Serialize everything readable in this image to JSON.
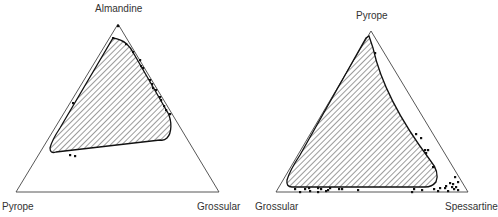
{
  "diagrams": [
    {
      "id": "left",
      "type": "ternary",
      "labels": {
        "top": "Almandine",
        "left": "Pyrope",
        "right": "Grossular"
      },
      "triangle": [
        [
          118,
          24
        ],
        [
          16,
          192
        ],
        [
          219,
          192
        ]
      ],
      "region": "M113,38 C125,40 130,46 134,54 L168,113 C172,121 172,133 167,138 Q164,141 160,140 L56,152 Q50,154 50,148 Q52,140 60,128 Z",
      "points": [
        [
          118,
          26
        ],
        [
          113,
          38
        ],
        [
          126,
          44
        ],
        [
          133,
          52
        ],
        [
          140,
          60
        ],
        [
          141,
          66
        ],
        [
          143,
          68
        ],
        [
          150,
          80
        ],
        [
          152,
          84
        ],
        [
          153,
          88
        ],
        [
          156,
          90
        ],
        [
          160,
          97
        ],
        [
          161,
          100
        ],
        [
          164,
          106
        ],
        [
          166,
          110
        ],
        [
          170,
          114
        ],
        [
          73,
          103
        ],
        [
          70,
          155
        ],
        [
          75,
          156
        ]
      ]
    },
    {
      "id": "right",
      "type": "ternary",
      "labels": {
        "top": "Pyrope",
        "left": "Grossular",
        "right": "Spessartine"
      },
      "triangle": [
        [
          371,
          31
        ],
        [
          276,
          192
        ],
        [
          468,
          192
        ]
      ],
      "region": "M369,36 L373,48 C380,80 400,120 430,160 Q440,172 436,182 Q432,187 425,187 L292,187 Q286,187 287,180 Q290,170 300,155 L366,38 Z",
      "points": [
        [
          375,
          53
        ],
        [
          416,
          134
        ],
        [
          421,
          138
        ],
        [
          425,
          150
        ],
        [
          428,
          150
        ],
        [
          426,
          153
        ],
        [
          433,
          167
        ],
        [
          455,
          177
        ],
        [
          458,
          182
        ],
        [
          450,
          183
        ],
        [
          453,
          184
        ],
        [
          452,
          187
        ],
        [
          456,
          187
        ],
        [
          446,
          186
        ],
        [
          445,
          188
        ],
        [
          454,
          189
        ],
        [
          458,
          190
        ],
        [
          448,
          191
        ],
        [
          434,
          189
        ],
        [
          440,
          188
        ],
        [
          438,
          191
        ],
        [
          422,
          190
        ],
        [
          414,
          189
        ],
        [
          412,
          192
        ],
        [
          330,
          188
        ],
        [
          326,
          191
        ],
        [
          321,
          189
        ],
        [
          318,
          192
        ],
        [
          318,
          188
        ],
        [
          310,
          191
        ],
        [
          309,
          188
        ],
        [
          305,
          189
        ],
        [
          300,
          192
        ],
        [
          295,
          189
        ],
        [
          328,
          190
        ],
        [
          339,
          189
        ],
        [
          342,
          189
        ],
        [
          358,
          190
        ]
      ]
    }
  ]
}
